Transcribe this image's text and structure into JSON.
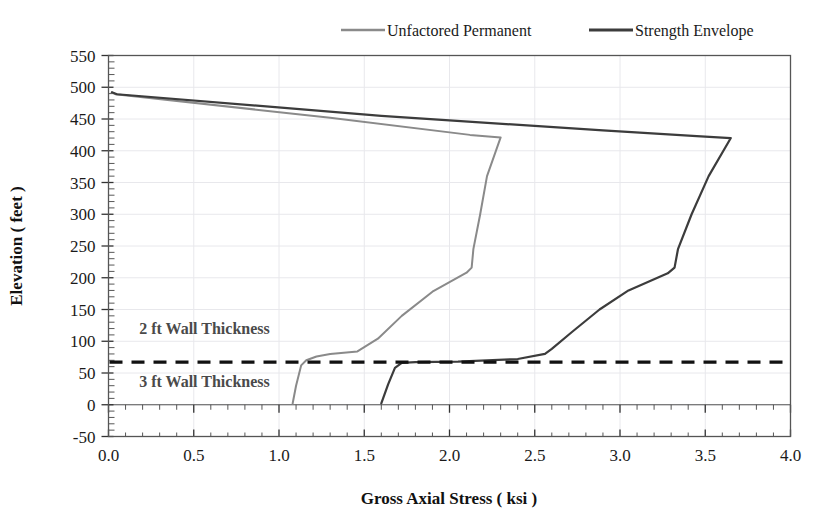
{
  "chart_data": {
    "type": "line",
    "title": "",
    "xlabel": "Gross Axial Stress ( ksi )",
    "ylabel": "Elevation ( feet )",
    "xlim": [
      0.0,
      4.0
    ],
    "ylim": [
      -50,
      550
    ],
    "xticks": [
      0.0,
      0.5,
      1.0,
      1.5,
      2.0,
      2.5,
      3.0,
      3.5,
      4.0
    ],
    "xtick_labels": [
      "0.0",
      "0.5",
      "1.0",
      "1.5",
      "2.0",
      "2.5",
      "3.0",
      "3.5",
      "4.0"
    ],
    "yticks": [
      -50,
      0,
      50,
      100,
      150,
      200,
      250,
      300,
      350,
      400,
      450,
      500,
      550
    ],
    "ytick_labels": [
      "-50",
      "0",
      "50",
      "100",
      "150",
      "200",
      "250",
      "300",
      "350",
      "400",
      "450",
      "500",
      "550"
    ],
    "x_minor_step": 0.1,
    "y_minor_step": 10,
    "grid": true,
    "grid_color": "#e8e8ec",
    "legend_position": "top",
    "orientation": "x = stress, y = elevation (profile plot)",
    "series": [
      {
        "name": "Unfactored Permanent",
        "color": "#8a8a8a",
        "width": 2.0,
        "points": [
          [
            0.02,
            492
          ],
          [
            0.04,
            489
          ],
          [
            1.3,
            452
          ],
          [
            2.12,
            425
          ],
          [
            2.3,
            421
          ],
          [
            2.22,
            360
          ],
          [
            2.18,
            300
          ],
          [
            2.14,
            245
          ],
          [
            2.13,
            216
          ],
          [
            2.1,
            208
          ],
          [
            1.9,
            178
          ],
          [
            1.72,
            140
          ],
          [
            1.58,
            104
          ],
          [
            1.46,
            84
          ],
          [
            1.3,
            80
          ],
          [
            1.22,
            76
          ],
          [
            1.16,
            70
          ],
          [
            1.13,
            62
          ],
          [
            1.1,
            30
          ],
          [
            1.08,
            2
          ]
        ]
      },
      {
        "name": "Strength Envelope",
        "color": "#3c3c3c",
        "width": 2.2,
        "points": [
          [
            0.02,
            492
          ],
          [
            0.05,
            489
          ],
          [
            1.6,
            455
          ],
          [
            2.9,
            432
          ],
          [
            3.45,
            423
          ],
          [
            3.65,
            420
          ],
          [
            3.52,
            360
          ],
          [
            3.42,
            300
          ],
          [
            3.34,
            245
          ],
          [
            3.32,
            216
          ],
          [
            3.28,
            207
          ],
          [
            3.05,
            180
          ],
          [
            2.88,
            150
          ],
          [
            2.72,
            115
          ],
          [
            2.6,
            88
          ],
          [
            2.56,
            80
          ],
          [
            2.4,
            72
          ],
          [
            2.05,
            68
          ],
          [
            1.8,
            67
          ],
          [
            1.72,
            66
          ],
          [
            1.68,
            58
          ],
          [
            1.64,
            32
          ],
          [
            1.6,
            2
          ]
        ]
      }
    ],
    "annotations": [
      {
        "text": "2 ft Wall Thickness",
        "x": 0.18,
        "y": 112,
        "color": "#4a4a4a"
      },
      {
        "text": "3 ft Wall Thickness",
        "x": 0.18,
        "y": 28,
        "color": "#4a4a4a"
      }
    ],
    "reference_lines": [
      {
        "name": "wall-thickness-transition",
        "orientation": "horizontal",
        "y": 67,
        "style": "dashed",
        "color": "#111111"
      },
      {
        "name": "elevation-zero",
        "orientation": "horizontal",
        "y": 0,
        "style": "solid",
        "color": "#555555"
      }
    ]
  }
}
